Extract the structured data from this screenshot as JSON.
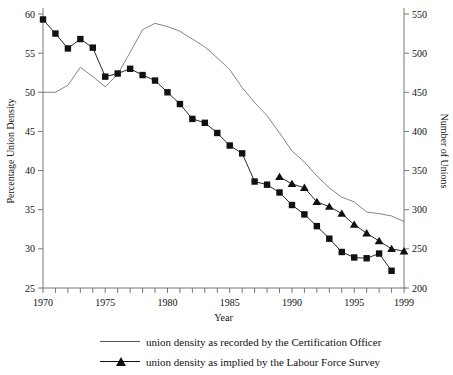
{
  "chart_data": {
    "type": "line",
    "title": "",
    "xlabel": "Year",
    "ylabel": "Percentage Union Density",
    "y2label": "Number of Unions",
    "xlim": [
      1970,
      1999
    ],
    "ylim": [
      25,
      60
    ],
    "y2lim": [
      200,
      550
    ],
    "xticks": [
      1970,
      1975,
      1980,
      1985,
      1990,
      1995,
      1999
    ],
    "xtick_labels": [
      "1970",
      "1975",
      "1980",
      "1985",
      "1990",
      "1995",
      "1999"
    ],
    "yticks": [
      25,
      30,
      35,
      40,
      45,
      50,
      55,
      60
    ],
    "ytick_labels": [
      "25",
      "30",
      "35",
      "40",
      "45",
      "50",
      "55",
      "60"
    ],
    "y2ticks": [
      200,
      250,
      300,
      350,
      400,
      450,
      500,
      550
    ],
    "y2tick_labels": [
      "200",
      "250",
      "300",
      "350",
      "400",
      "450",
      "500",
      "550"
    ],
    "minor_xticks_every": 1,
    "grid": false,
    "legend_position": "below",
    "series": [
      {
        "name": "union density as recorded by the Certification Officer",
        "axis": "right",
        "marker": "none",
        "color": "#666666",
        "x": [
          1970,
          1971,
          1972,
          1973,
          1974,
          1975,
          1976,
          1977,
          1978,
          1979,
          1980,
          1981,
          1982,
          1983,
          1984,
          1985,
          1986,
          1987,
          1988,
          1989,
          1990,
          1991,
          1992,
          1993,
          1994,
          1995,
          1996,
          1997,
          1998,
          1999
        ],
        "values": [
          450,
          450,
          459,
          482,
          470,
          457,
          473,
          501,
          530,
          538,
          534,
          528,
          518,
          508,
          494,
          479,
          456,
          437,
          420,
          398,
          375,
          361,
          343,
          328,
          316,
          310,
          297,
          295,
          292,
          285
        ]
      },
      {
        "name": "union density as implied by the Labour Force Survey",
        "axis": "left",
        "marker": "square",
        "color": "#111111",
        "x": [
          1970,
          1971,
          1972,
          1973,
          1974,
          1975,
          1976,
          1977,
          1978,
          1979,
          1980,
          1981,
          1982,
          1983,
          1984,
          1985,
          1986,
          1987,
          1988,
          1989,
          1990,
          1991,
          1992,
          1993,
          1994,
          1995,
          1996,
          1997,
          1998
        ],
        "values": [
          59.3,
          57.5,
          55.6,
          56.8,
          55.7,
          52.0,
          52.4,
          53.0,
          52.2,
          51.5,
          50.0,
          48.5,
          46.6,
          46.1,
          44.8,
          43.2,
          42.2,
          38.6,
          38.2,
          37.2,
          35.6,
          34.4,
          32.9,
          31.3,
          29.6,
          28.9,
          28.8,
          29.4,
          27.2
        ]
      },
      {
        "name": "union density as implied by the Labour Force Survey (triangles)",
        "axis": "left",
        "marker": "triangle",
        "color": "#111111",
        "x": [
          1989,
          1990,
          1991,
          1992,
          1993,
          1994,
          1995,
          1996,
          1997,
          1998,
          1999
        ],
        "values": [
          39.2,
          38.3,
          37.8,
          36.0,
          35.4,
          34.5,
          33.1,
          32.0,
          31.0,
          30.0,
          29.7
        ]
      }
    ]
  },
  "legend": {
    "items": [
      {
        "label": "union density as recorded by the Certification Officer",
        "marker": "line"
      },
      {
        "label": "union density as implied by the Labour Force Survey",
        "marker": "line-triangle"
      }
    ]
  },
  "axes": {
    "x_title": "Year",
    "y_left_title": "Percentage Union Density",
    "y_right_title": "Number of Unions"
  }
}
